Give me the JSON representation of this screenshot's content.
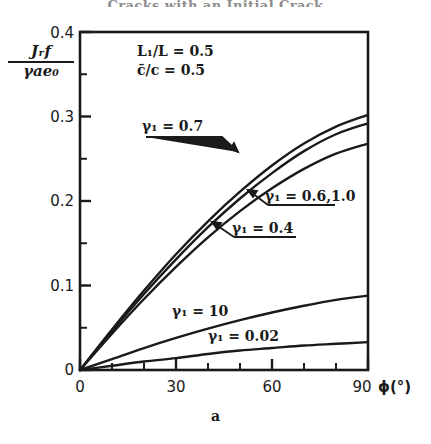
{
  "header": {
    "title": "Cracks with an Initial Crack"
  },
  "figure": {
    "panel_caption": "a",
    "y_axis_label_numerator": "Jᵣf",
    "y_axis_label_denominator": "γae₀",
    "x_axis_title": "ϕ(°)",
    "annotations": [
      {
        "name": "ratio-L1-L",
        "text": "L₁/L = 0.5"
      },
      {
        "name": "ratio-cbar-c",
        "text": "c̄/c  = 0.5"
      }
    ],
    "curve_labels": [
      {
        "name": "label-gamma-0-7",
        "text": "γ₁ = 0.7",
        "x": 142,
        "y": 120
      },
      {
        "name": "label-gamma-0-6-1",
        "text": "γ₁ = 0.6,1.0",
        "x": 265,
        "y": 190
      },
      {
        "name": "label-gamma-0-4",
        "text": "γ₁ = 0.4",
        "x": 232,
        "y": 222
      },
      {
        "name": "label-gamma-10",
        "text": "γ₁ = 10",
        "x": 172,
        "y": 305
      },
      {
        "name": "label-gamma-0-02",
        "text": "γ₁ = 0.02",
        "x": 208,
        "y": 330
      }
    ]
  },
  "chart_data": {
    "type": "line",
    "title": "",
    "xlabel": "ϕ(°)",
    "ylabel": "Jᵣf / γae₀",
    "xlim": [
      0,
      90
    ],
    "ylim": [
      0,
      0.4
    ],
    "xticks": [
      0,
      30,
      60,
      90
    ],
    "xtick_labels": [
      "0",
      "30",
      "60",
      "90"
    ],
    "x_minor_tick_step": 10,
    "yticks": [
      0,
      0.1,
      0.2,
      0.3,
      0.4
    ],
    "ytick_labels": [
      "0",
      "0.1",
      "0.2",
      "0.3",
      "0.4"
    ],
    "y_minor_tick_step": 0.05,
    "grid": false,
    "legend": "inline-annotations",
    "parameters": {
      "L1_over_L": 0.5,
      "cbar_over_c": 0.5
    },
    "series": [
      {
        "name": "γ₁ = 0.7",
        "x": [
          0,
          10,
          20,
          30,
          40,
          50,
          60,
          70,
          80,
          90
        ],
        "values": [
          0.0,
          0.048,
          0.094,
          0.137,
          0.176,
          0.211,
          0.242,
          0.268,
          0.288,
          0.302
        ]
      },
      {
        "name": "γ₁ = 0.6,1.0",
        "x": [
          0,
          10,
          20,
          30,
          40,
          50,
          60,
          70,
          80,
          90
        ],
        "values": [
          0.0,
          0.046,
          0.09,
          0.131,
          0.169,
          0.203,
          0.233,
          0.259,
          0.279,
          0.292
        ]
      },
      {
        "name": "γ₁ = 0.4",
        "x": [
          0,
          10,
          20,
          30,
          40,
          50,
          60,
          70,
          80,
          90
        ],
        "values": [
          0.0,
          0.043,
          0.084,
          0.122,
          0.157,
          0.188,
          0.215,
          0.238,
          0.256,
          0.268
        ]
      },
      {
        "name": "γ₁ = 10",
        "x": [
          0,
          10,
          20,
          30,
          40,
          50,
          60,
          70,
          80,
          90
        ],
        "values": [
          0.0,
          0.013,
          0.026,
          0.038,
          0.049,
          0.059,
          0.068,
          0.076,
          0.083,
          0.088
        ]
      },
      {
        "name": "γ₁ = 0.02",
        "x": [
          0,
          10,
          20,
          30,
          40,
          50,
          60,
          70,
          80,
          90
        ],
        "values": [
          0.0,
          0.005,
          0.01,
          0.014,
          0.019,
          0.023,
          0.026,
          0.029,
          0.031,
          0.033
        ]
      }
    ]
  }
}
